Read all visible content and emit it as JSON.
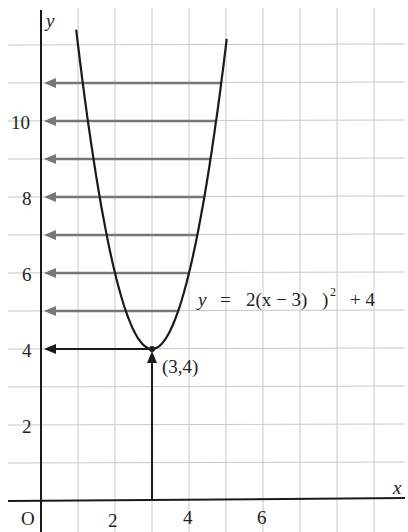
{
  "chart_data": {
    "type": "line",
    "title": "",
    "xlabel": "x",
    "ylabel": "y",
    "origin_label": "O",
    "xlim": [
      0,
      9.7
    ],
    "ylim": [
      0,
      13
    ],
    "grid": true,
    "x_ticks": [
      2,
      4,
      6
    ],
    "y_ticks": [
      2,
      4,
      6,
      8,
      10
    ],
    "series": [
      {
        "name": "y = 2(x − 3)² + 4",
        "function": "2*(x-3)^2+4",
        "x_range": [
          1,
          5
        ],
        "color": "#1a1a1a"
      }
    ],
    "annotations": {
      "equation": "y = 2(x − 3)² + 4",
      "vertex_label": "(3,4)",
      "vertex": [
        3,
        4
      ],
      "vertical_arrow": {
        "from": [
          3,
          0
        ],
        "to": [
          3,
          4
        ],
        "color": "#1a1a1a"
      },
      "horizontal_arrow_vertex": {
        "from": [
          3,
          4
        ],
        "to": [
          0,
          4
        ],
        "color": "#1a1a1a"
      },
      "horizontal_arrows": [
        {
          "y": 5
        },
        {
          "y": 6
        },
        {
          "y": 7
        },
        {
          "y": 8
        },
        {
          "y": 9
        },
        {
          "y": 10
        },
        {
          "y": 11
        }
      ],
      "horizontal_arrow_color": "#777777"
    }
  },
  "labels": {
    "y_axis": "y",
    "x_axis": "x",
    "origin": "O",
    "equation_y": "y",
    "equation_eq": "=",
    "equation_body": "2(x − 3)",
    "equation_sup": "2",
    "equation_tail": "+ 4",
    "vertex": "(3,4)",
    "xt2": "2",
    "xt4": "4",
    "xt6": "6",
    "yt2": "2",
    "yt4": "4",
    "yt6": "6",
    "yt8": "8",
    "yt10": "10"
  }
}
